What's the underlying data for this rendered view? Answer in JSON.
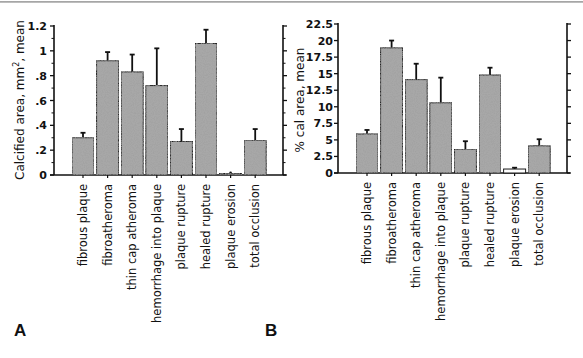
{
  "chart_data": [
    {
      "panel": "A",
      "type": "bar",
      "title": "",
      "ylabel": "Calcified area, mm², mean",
      "ylabel_main": "Calcified area, mm",
      "ylabel_sup": "2",
      "ylabel_rest": ", mean",
      "xlabel": "",
      "ylim": [
        0,
        1.2
      ],
      "yticks": [
        0,
        0.2,
        0.4,
        0.6,
        0.8,
        1.0,
        1.2
      ],
      "ytick_labels": [
        "0",
        ".2",
        ".4",
        ".6",
        ".8",
        "1",
        "1.2"
      ],
      "grid": false,
      "categories": [
        "fibrous plaque",
        "fibroatheroma",
        "thin cap atheroma",
        "hemorrhage into plaque",
        "plaque rupture",
        "healed rupture",
        "plaque erosion",
        "total occlusion"
      ],
      "values": [
        0.3,
        0.92,
        0.83,
        0.72,
        0.27,
        1.06,
        0.01,
        0.28
      ],
      "error_plus": [
        0.04,
        0.07,
        0.14,
        0.3,
        0.1,
        0.11,
        0.0,
        0.09
      ]
    },
    {
      "panel": "B",
      "type": "bar",
      "title": "",
      "ylabel": "% cal area, mean",
      "xlabel": "",
      "ylim": [
        0,
        22.5
      ],
      "yticks": [
        0,
        2.5,
        5,
        7.5,
        10,
        12.5,
        15,
        17.5,
        20,
        22.5
      ],
      "ytick_labels": [
        "0",
        "2.5",
        "5",
        "7.5",
        "10",
        "12.5",
        "15",
        "17.5",
        "20",
        "22.5"
      ],
      "grid": false,
      "categories": [
        "fibrous plaque",
        "fibroatheroma",
        "thin cap atheroma",
        "hemorrhage into plaque",
        "plaque rupture",
        "healed rupture",
        "plaque erosion",
        "total occlusion"
      ],
      "values": [
        5.9,
        18.9,
        14.1,
        10.6,
        3.6,
        14.8,
        0.6,
        4.1
      ],
      "error_plus": [
        0.6,
        1.1,
        2.4,
        3.8,
        1.2,
        1.1,
        0.2,
        1.0
      ]
    }
  ],
  "panels": {
    "a_label": "A",
    "b_label": "B"
  },
  "colors": {
    "bar_fill": "#a8a8a8",
    "bar_stroke": "#1a1a1a",
    "axis": "#111111",
    "erosion_bar_b": "#ffffff"
  }
}
